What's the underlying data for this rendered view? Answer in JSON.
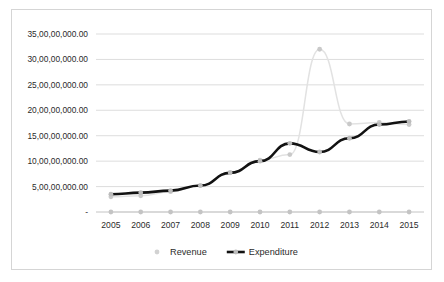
{
  "chart_data": {
    "type": "line",
    "title": "",
    "xlabel": "",
    "ylabel": "",
    "categories": [
      "2005",
      "2006",
      "2007",
      "2008",
      "2009",
      "2010",
      "2011",
      "2012",
      "2013",
      "2014",
      "2015"
    ],
    "series": [
      {
        "name": "Revenue",
        "color": "#e2e2e2",
        "marker_color": "#c9c9c9",
        "values": [
          30000000,
          32000000,
          40000000,
          52000000,
          78000000,
          102000000,
          113000000,
          320000000,
          173000000,
          176000000,
          172000000
        ]
      },
      {
        "name": "Expenditure",
        "color": "#121212",
        "marker_color": "#bcbcbc",
        "values": [
          35000000,
          38000000,
          42000000,
          52000000,
          77000000,
          100000000,
          135000000,
          118000000,
          145000000,
          172000000,
          178000000
        ]
      },
      {
        "name": "",
        "color": "#d6d6d6",
        "marker_color": "#c4c4c4",
        "values": [
          0,
          0,
          0,
          0,
          0,
          0,
          0,
          0,
          0,
          0,
          0
        ]
      }
    ],
    "ylim": [
      0,
      350000000
    ],
    "ytick_values": [
      0,
      50000000,
      100000000,
      150000000,
      200000000,
      250000000,
      300000000,
      350000000
    ],
    "ytick_labels": [
      "-",
      "5,00,00,000.00",
      "10,00,00,000.00",
      "15,00,00,000.00",
      "20,00,00,000.00",
      "25,00,00,000.00",
      "30,00,00,000.00",
      "35,00,00,000.00"
    ],
    "grid": true,
    "legend_position": "bottom",
    "legend_entries": [
      {
        "label": "Revenue",
        "style": "marker"
      },
      {
        "label": "Expenditure",
        "style": "line-marker"
      }
    ]
  }
}
